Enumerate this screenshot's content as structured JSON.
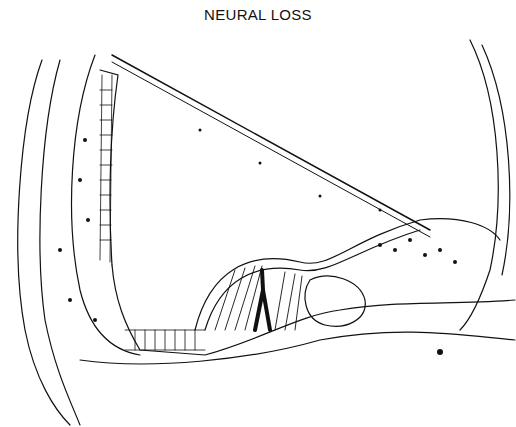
{
  "figure": {
    "title": "NEURAL LOSS",
    "style": "black line drawing on white"
  }
}
